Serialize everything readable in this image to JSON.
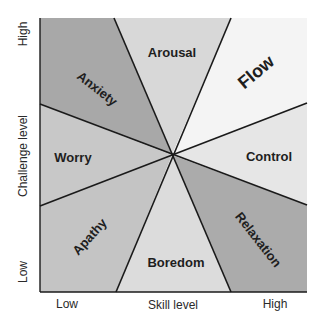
{
  "diagram": {
    "center": [
      172,
      155
    ],
    "box": {
      "left": 40,
      "top": 18,
      "right": 307,
      "bottom": 292
    },
    "regions": [
      {
        "id": "anxiety",
        "label": "Anxiety",
        "fill": "#a8a8a8"
      },
      {
        "id": "arousal",
        "label": "Arousal",
        "fill": "#d8d8d8"
      },
      {
        "id": "flow",
        "label": "Flow",
        "fill": "#f4f4f4"
      },
      {
        "id": "control",
        "label": "Control",
        "fill": "#e6e6e6"
      },
      {
        "id": "relaxation",
        "label": "Relaxation",
        "fill": "#ababab"
      },
      {
        "id": "boredom",
        "label": "Boredom",
        "fill": "#dcdcdc"
      },
      {
        "id": "apathy",
        "label": "Apathy",
        "fill": "#c4c4c4"
      },
      {
        "id": "worry",
        "label": "Worry",
        "fill": "#c8c8c8"
      }
    ],
    "x_axis": {
      "title": "Skill level",
      "low": "Low",
      "high": "High"
    },
    "y_axis": {
      "title": "Challenge level",
      "low": "Low",
      "high": "High"
    },
    "line_color": "#1a1a1a"
  }
}
